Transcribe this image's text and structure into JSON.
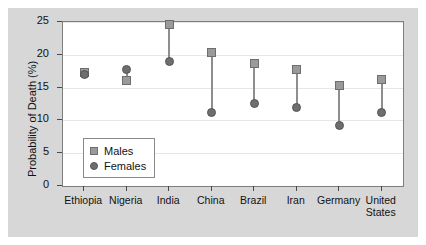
{
  "chart_data": {
    "type": "scatter",
    "title": "",
    "xlabel": "",
    "ylabel": "Probability of Death (%)",
    "categories": [
      "Ethiopia",
      "Nigeria",
      "India",
      "China",
      "Brazil",
      "Iran",
      "Germany",
      "United States"
    ],
    "series": [
      {
        "name": "Males",
        "marker": "square",
        "color": "#9a9a9a",
        "values": [
          17.3,
          16.1,
          24.6,
          20.4,
          18.7,
          17.8,
          15.3,
          16.2
        ]
      },
      {
        "name": "Females",
        "marker": "circle",
        "color": "#6e6e6e",
        "values": [
          17.0,
          17.8,
          19.0,
          11.2,
          12.6,
          12.0,
          9.2,
          11.2
        ]
      }
    ],
    "ylim": [
      0,
      25
    ],
    "yticks": [
      0,
      5,
      10,
      15,
      20,
      25
    ],
    "ytick_labels": [
      "0",
      "5",
      "10",
      "15",
      "20",
      "25"
    ],
    "grid": true,
    "legend_position": "lower-left-inside",
    "connector_color": "#8e8e8e"
  },
  "legend": {
    "entries": [
      {
        "label": "Males",
        "marker": "square"
      },
      {
        "label": "Females",
        "marker": "circle"
      }
    ]
  },
  "colors": {
    "figure_background": "#d7d7d7",
    "plot_background": "#ffffff",
    "axis": "#7d7d7d",
    "gridline": "#e6e6e6",
    "text": "#121212"
  }
}
